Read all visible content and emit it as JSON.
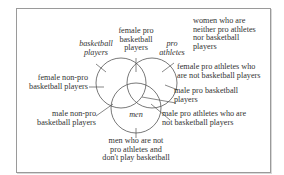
{
  "diagram": {
    "type": "venn",
    "sets": [
      {
        "name": "basketball players",
        "italic": true
      },
      {
        "name": "pro athletes",
        "italic": true
      },
      {
        "name": "men",
        "italic": true
      }
    ],
    "set_labels": {
      "basketball_line1": "basketball",
      "basketball_line2": "players",
      "pro_line1": "pro",
      "pro_line2": "athletes",
      "men": "men"
    },
    "region_labels": {
      "female_pro_bb": [
        "female pro",
        "basketball",
        "players"
      ],
      "women_neither": [
        "women who are",
        "neither pro athletes",
        "nor basketball",
        "players"
      ],
      "female_pro_not_bb": [
        "female pro athletes who",
        "are not basketball players"
      ],
      "male_pro_bb": [
        "male pro basketball",
        "players"
      ],
      "male_pro_not_bb": [
        "male pro athletes who are",
        "not basketball players"
      ],
      "men_neither": [
        "men who are not",
        "pro athletes and",
        "don't play basketball"
      ],
      "male_nonpro_bb": [
        "male non-pro",
        "basketball players"
      ],
      "female_nonpro_bb": [
        "female non-pro",
        "basketball players"
      ]
    },
    "colors": {
      "stroke": "#555555",
      "text": "#333333",
      "frame": "#9a9a9a"
    }
  }
}
